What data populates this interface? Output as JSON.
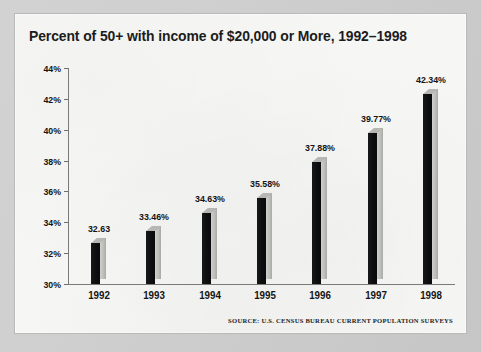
{
  "chart_data": {
    "type": "bar",
    "title": "Percent of 50+ with income of $20,000 or More, 1992–1998",
    "xlabel": "",
    "ylabel": "",
    "categories": [
      "1992",
      "1993",
      "1994",
      "1995",
      "1996",
      "1997",
      "1998"
    ],
    "values": [
      32.63,
      33.46,
      34.63,
      35.58,
      37.88,
      39.77,
      42.34
    ],
    "data_labels": [
      "32.63",
      "33.46%",
      "34.63%",
      "35.58%",
      "37.88%",
      "39.77%",
      "42.34%"
    ],
    "ylim": [
      30,
      44
    ],
    "y_ticks": [
      30,
      32,
      34,
      36,
      38,
      40,
      42,
      44
    ],
    "y_tick_labels": [
      "30%",
      "32%",
      "34%",
      "36%",
      "38%",
      "40%",
      "42%",
      "44%"
    ],
    "grid": false,
    "legend": false,
    "series": [
      {
        "name": "Percent of 50+ with income of $20,000 or More",
        "values": [
          32.63,
          33.46,
          34.63,
          35.58,
          37.88,
          39.77,
          42.34
        ]
      }
    ],
    "bar_style": "3d-extruded",
    "colors": {
      "bar_front": "#0d0e10",
      "bar_side": "#bcbcb8",
      "bar_top": "#b6b6b2",
      "axis": "#7a7a7a",
      "text": "#141414",
      "panel_background": "#f6f6f5",
      "page_background": "#cfcfcf"
    }
  },
  "source_note": "SOURCE: U.S. CENSUS BUREAU CURRENT POPULATION SURVEYS"
}
